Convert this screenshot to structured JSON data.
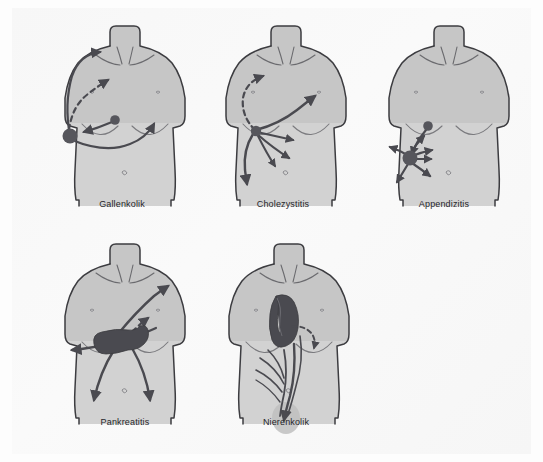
{
  "figure": {
    "kind": "medical-illustration",
    "language": "de",
    "panel_count": 5,
    "background_color": "#fdfdfd",
    "page_tint_color": "#f7f7f7",
    "body_fill_color": "#cfcfcf",
    "body_upper_fill_color": "#c2c2c2",
    "outline_color": "#3c3c40",
    "marker_color": "#5a5a60",
    "organ_color": "#4a4a50",
    "arrow_color": "#4a4a50",
    "caption_color": "#26262a"
  },
  "panels": [
    {
      "id": "gallenkolik",
      "label": "Gallenkolik",
      "row": 1,
      "column": 1,
      "caption_x": 82,
      "caption_y": 199,
      "caption_width": 80,
      "pain_origin": "right upper quadrant",
      "radiation": [
        "right shoulder",
        "epigastrium",
        "right flank band"
      ],
      "markers": [
        {
          "name": "primary-pain-point",
          "cx": 68,
          "cy": 134,
          "r": 7
        },
        {
          "name": "secondary-pain-point",
          "cx": 113,
          "cy": 122,
          "r": 4.5
        }
      ]
    },
    {
      "id": "cholezystitis",
      "label": "Cholezystitis",
      "row": 1,
      "column": 2,
      "caption_x": 243,
      "caption_y": 199,
      "caption_width": 80,
      "pain_origin": "gallbladder / right subcostal",
      "radiation": [
        "right scapula",
        "epigastrium",
        "right flank",
        "lower abdomen"
      ],
      "markers": [
        {
          "name": "primary-pain-point",
          "cx": 256,
          "cy": 128,
          "r": 5
        }
      ]
    },
    {
      "id": "appendizitis",
      "label": "Appendizitis",
      "row": 1,
      "column": 3,
      "caption_x": 404,
      "caption_y": 199,
      "caption_width": 80,
      "pain_origin": "right lower quadrant (McBurney)",
      "radiation": [
        "periumbilical",
        "right iliac fossa",
        "suprapubic"
      ],
      "markers": [
        {
          "name": "primary-pain-point",
          "cx": 411,
          "cy": 157,
          "r": 7
        },
        {
          "name": "secondary-pain-point",
          "cx": 428,
          "cy": 124,
          "r": 4.5
        }
      ]
    },
    {
      "id": "pankreatitis",
      "label": "Pankreatitis",
      "row": 2,
      "column": 1,
      "caption_x": 85,
      "caption_y": 417,
      "caption_width": 80,
      "pain_origin": "epigastrium / pancreas",
      "radiation": [
        "left shoulder",
        "belt-like to back",
        "both lower quadrants"
      ],
      "organ": "pancreas",
      "markers": []
    },
    {
      "id": "nierenkolik",
      "label": "Nierenkolik",
      "row": 2,
      "column": 2,
      "caption_x": 246,
      "caption_y": 417,
      "caption_width": 80,
      "pain_origin": "kidney / flank",
      "radiation": [
        "along ureter",
        "groin",
        "genitals"
      ],
      "organ": "kidney",
      "markers": []
    }
  ],
  "source_credit": {
    "text": ""
  }
}
